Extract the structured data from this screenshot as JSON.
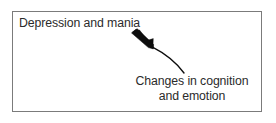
{
  "figure": {
    "type": "diagram",
    "background_color": "#ffffff",
    "frame": {
      "name": "diagram-frame",
      "border_color": "#7b7b7b",
      "border_width_px": 1,
      "fill": "#ffffff",
      "x": 12,
      "y": 11,
      "width": 250,
      "height": 101
    },
    "text_color": "#2b2b2b",
    "labels": {
      "source": "Depression and mania",
      "target_line1": "Changes in cognition",
      "target_line2": "and emotion"
    },
    "arrow": {
      "name": "curved-arrow",
      "color": "#000000",
      "direction": "from Changes in cognition and emotion toward Depression and mania",
      "head_position": "upper-left",
      "tail_position": "lower-right",
      "style": "curved tapered arrow with solid triangular head"
    }
  }
}
